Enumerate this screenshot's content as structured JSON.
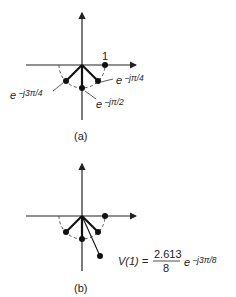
{
  "figure": {
    "panels": [
      {
        "id": "a",
        "caption": "(a)",
        "labels": {
          "one": "1",
          "e_pi4_base": "e",
          "e_pi4_exp": "−jπ/4",
          "e_pi2_base": "e",
          "e_pi2_exp": "−jπ/2",
          "e_3pi4_base": "e",
          "e_3pi4_exp": "−j3π/4"
        },
        "points": [
          {
            "name": "1",
            "angle_deg": 0
          },
          {
            "name": "e^{-jπ/4}",
            "angle_deg": -45
          },
          {
            "name": "e^{-jπ/2}",
            "angle_deg": -90
          },
          {
            "name": "e^{-j3π/4}",
            "angle_deg": -135
          }
        ]
      },
      {
        "id": "b",
        "caption": "(b)",
        "equation": {
          "lhs": "V(1) =",
          "numerator": "2.613",
          "denominator": "8",
          "exp_base": "e",
          "exp_power": "−j3π/8"
        },
        "points": [
          {
            "name": "1",
            "angle_deg": 0
          },
          {
            "name": "e^{-jπ/4}",
            "angle_deg": -45
          },
          {
            "name": "e^{-jπ/2}",
            "angle_deg": -90
          },
          {
            "name": "e^{-j3π/4}",
            "angle_deg": -135
          },
          {
            "name": "V(1)",
            "angle_deg": -67.5,
            "magnitude": "2.613/8 (scaled)"
          }
        ]
      }
    ]
  }
}
